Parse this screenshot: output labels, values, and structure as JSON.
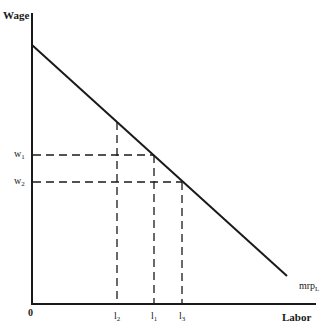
{
  "diagram": {
    "type": "labor-demand-curve",
    "y_axis_label": "Wage",
    "x_axis_label": "Labor",
    "origin_label": "0",
    "curve": {
      "label_main": "mrp",
      "label_sub": "L",
      "from": [
        32,
        45
      ],
      "to": [
        287,
        276
      ]
    },
    "wage_levels": [
      {
        "label_main": "w",
        "label_sub": "1",
        "y": 155
      },
      {
        "label_main": "w",
        "label_sub": "2",
        "y": 182
      }
    ],
    "labor_levels": [
      {
        "label_main": "l",
        "label_sub": "2",
        "x": 117
      },
      {
        "label_main": "l",
        "label_sub": "1",
        "x": 154
      },
      {
        "label_main": "l",
        "label_sub": "3",
        "x": 182
      }
    ],
    "colors": {
      "line": "#1a1a1a",
      "background": "#ffffff"
    }
  }
}
